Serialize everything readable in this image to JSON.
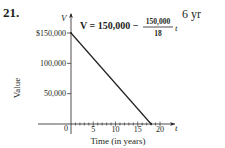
{
  "problem": {
    "number": "21.",
    "answer": "6 yr"
  },
  "chart_data": {
    "type": "line",
    "title": "",
    "equation": {
      "lhs": "V = 150,000 −",
      "numerator": "150,000",
      "denominator": "18",
      "variable": "t"
    },
    "xlabel": "Time (in years)",
    "ylabel": "Value",
    "x_axis_var": "t",
    "y_axis_var": "V",
    "xlim": [
      0,
      20
    ],
    "ylim": [
      0,
      150000
    ],
    "x_ticks": [
      {
        "value": 5,
        "label": "5"
      },
      {
        "value": 10,
        "label": "10"
      },
      {
        "value": 15,
        "label": "15"
      },
      {
        "value": 20,
        "label": "20"
      }
    ],
    "x_minor_step": 1,
    "origin_label": "0",
    "y_ticks": [
      {
        "value": 50000,
        "label": "50,000"
      },
      {
        "value": 100000,
        "label": "100,000"
      },
      {
        "value": 150000,
        "label": "$150,000"
      }
    ],
    "series": [
      {
        "name": "V",
        "points": [
          [
            0,
            150000
          ],
          [
            18,
            0
          ]
        ]
      }
    ],
    "grid": false,
    "legend": "none"
  }
}
